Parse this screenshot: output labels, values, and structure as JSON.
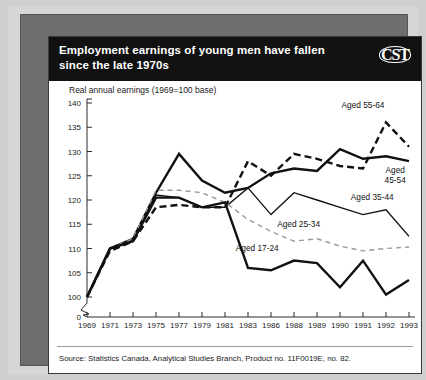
{
  "header": {
    "title": "Employment earnings of young men have fallen since the late 1970s",
    "logo": "CST"
  },
  "footer": {
    "source": "Source: Statistics Canada, Analytical Studies Branch, Product no. 11F0019E, no. 82."
  },
  "colors": {
    "title_bg": "#111111",
    "title_fg": "#ffffff",
    "frame": "#6e6e6e",
    "plot_bg": "#ffffff",
    "line_dark": "#111111",
    "line_grey": "#9a9a9a"
  },
  "chart_data": {
    "type": "line",
    "title": "Employment earnings of young men have fallen since the late 1970s",
    "subtitle": "",
    "ylabel": "Real annual earnings (1969=100 base)",
    "xlabel": "",
    "grid": false,
    "legend_position": "inline-labels",
    "axis_break": true,
    "ylim": [
      100,
      140
    ],
    "yticks": [
      100,
      105,
      110,
      115,
      120,
      125,
      130,
      135,
      140
    ],
    "ytick_labels": [
      "100",
      "105",
      "110",
      "115",
      "120",
      "125",
      "130",
      "135",
      "140"
    ],
    "zero_tick_label": "0",
    "x": [
      1969,
      1971,
      1973,
      1975,
      1977,
      1979,
      1981,
      1983,
      1986,
      1988,
      1989,
      1990,
      1991,
      1992,
      1993
    ],
    "xtick_labels": [
      "1969",
      "1971",
      "1973",
      "1975",
      "1977",
      "1979",
      "1981",
      "1983",
      "1986",
      "1988",
      "1989",
      "1990",
      "1991",
      "1992",
      "1993"
    ],
    "series": [
      {
        "name": "Aged 55-64",
        "label": "Aged 55-64",
        "style": "dashed",
        "width": "thick",
        "color": "#111111",
        "values": [
          100,
          109.5,
          111.5,
          118.5,
          119.0,
          118.5,
          118.5,
          128.0,
          125.0,
          129.5,
          128.5,
          127.0,
          126.5,
          136.0,
          131.0
        ]
      },
      {
        "name": "Aged 45-54",
        "label": "Aged 45-54",
        "style": "solid",
        "width": "thick",
        "color": "#111111",
        "values": [
          100,
          110.0,
          112.0,
          121.5,
          129.5,
          124.0,
          121.5,
          122.5,
          125.5,
          126.5,
          126.0,
          130.5,
          128.5,
          129.0,
          128.0
        ]
      },
      {
        "name": "Aged 35-44",
        "label": "Aged 35-44",
        "style": "solid",
        "width": "thin",
        "color": "#111111",
        "values": [
          100,
          110.0,
          111.5,
          121.0,
          120.5,
          118.5,
          118.5,
          122.5,
          117.0,
          121.5,
          120.0,
          118.5,
          117.0,
          118.0,
          112.5
        ]
      },
      {
        "name": "Aged 25-34",
        "label": "Aged 25-34",
        "style": "dashed",
        "width": "thin",
        "color": "#9a9a9a",
        "values": [
          100,
          110.0,
          112.0,
          122.0,
          122.0,
          121.5,
          119.5,
          116.0,
          113.5,
          111.5,
          112.0,
          110.5,
          109.5,
          110.0,
          110.3
        ]
      },
      {
        "name": "Aged 17-24",
        "label": "Aged 17-24",
        "style": "solid",
        "width": "thick",
        "color": "#111111",
        "values": [
          100,
          110.0,
          111.5,
          120.5,
          120.5,
          118.5,
          119.5,
          106.0,
          105.5,
          107.5,
          107.0,
          102.0,
          107.5,
          100.5,
          103.5
        ]
      }
    ],
    "annotations": [
      {
        "text": "Aged 55-64",
        "x": 1991,
        "y": 139.0
      },
      {
        "text": "Aged 45-54",
        "x": 1992.4,
        "y": 125.5
      },
      {
        "text": "Aged 35-44",
        "x": 1991.4,
        "y": 120.0
      },
      {
        "text": "Aged 25-34",
        "x": 1988.2,
        "y": 114.5
      },
      {
        "text": "Aged 17-24",
        "x": 1984.2,
        "y": 109.5
      }
    ]
  }
}
